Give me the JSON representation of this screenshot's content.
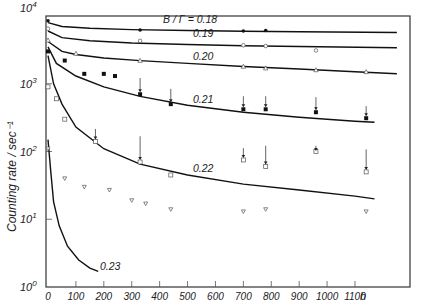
{
  "chart_data": {
    "type": "scatter",
    "title": "",
    "xlabel": "h",
    "ylabel": "Counting rate / sec⁻¹",
    "yscale": "log",
    "xlim": [
      0,
      1250
    ],
    "ylim": [
      1,
      10000
    ],
    "x_ticks": [
      0,
      100,
      200,
      300,
      400,
      500,
      600,
      700,
      800,
      900,
      1000,
      1100
    ],
    "x_tick_labels": [
      "0",
      "100",
      "200",
      "300",
      "400",
      "500",
      "600",
      "700",
      "800",
      "900",
      "1000",
      "1100"
    ],
    "y_ticks": [
      1,
      10,
      100,
      1000,
      10000
    ],
    "y_tick_labels": [
      {
        "base": "10",
        "exp": "0"
      },
      {
        "base": "10",
        "exp": "1"
      },
      {
        "base": "10",
        "exp": "2"
      },
      {
        "base": "10",
        "exp": "3"
      },
      {
        "base": "10",
        "exp": "4"
      }
    ],
    "grid": false,
    "legend_position": "inline curve labels",
    "parameter_label": "B / Γ =",
    "series": [
      {
        "name": "0.18",
        "label": "B / Γ = 0.18",
        "marker": "filled-circle",
        "curve": {
          "x": [
            0,
            50,
            150,
            300,
            500,
            700,
            900,
            1250
          ],
          "y": [
            8000,
            7000,
            6600,
            6300,
            6100,
            5950,
            5850,
            5700
          ]
        },
        "points": {
          "x": [
            0,
            330,
            700,
            780
          ],
          "y": [
            8500,
            6200,
            6000,
            6100
          ]
        }
      },
      {
        "name": "0.19",
        "label": "0.19",
        "marker": "open-circle",
        "curve": {
          "x": [
            0,
            50,
            150,
            300,
            500,
            700,
            900,
            1250
          ],
          "y": [
            6000,
            4800,
            4300,
            4000,
            3800,
            3650,
            3550,
            3400
          ]
        },
        "points": {
          "x": [
            0,
            330,
            700,
            780,
            960
          ],
          "y": [
            6500,
            4300,
            3700,
            3600,
            3100
          ]
        }
      },
      {
        "name": "0.20",
        "label": "0.20",
        "marker": "open-triangle",
        "curve": {
          "x": [
            0,
            50,
            100,
            200,
            330,
            500,
            700,
            900,
            1100,
            1250
          ],
          "y": [
            4200,
            3000,
            2700,
            2400,
            2200,
            2000,
            1800,
            1650,
            1500,
            1400
          ]
        },
        "points": {
          "x": [
            0,
            100,
            330,
            700,
            780,
            960,
            1140
          ],
          "y": [
            4400,
            2800,
            2200,
            1800,
            1700,
            1600,
            1500
          ]
        }
      },
      {
        "name": "0.21",
        "label": "0.21",
        "marker": "filled-square",
        "curve": {
          "x": [
            0,
            30,
            100,
            200,
            330,
            500,
            700,
            900,
            1100,
            1170
          ],
          "y": [
            3500,
            2000,
            1300,
            900,
            650,
            480,
            380,
            320,
            280,
            270
          ]
        },
        "points": {
          "x": [
            0,
            60,
            130,
            200,
            240,
            330,
            440,
            700,
            780,
            960,
            1140
          ],
          "y": [
            3000,
            2200,
            1400,
            1400,
            1300,
            700,
            500,
            420,
            420,
            380,
            310
          ]
        }
      },
      {
        "name": "0.22",
        "label": "0.22",
        "marker": "open-square",
        "curve": {
          "x": [
            0,
            20,
            50,
            100,
            200,
            330,
            500,
            700,
            900,
            1100,
            1170
          ],
          "y": [
            2600,
            1000,
            500,
            230,
            110,
            65,
            45,
            33,
            27,
            22,
            20
          ]
        },
        "points": {
          "x": [
            0,
            30,
            60,
            170,
            330,
            440,
            700,
            780,
            960,
            1140
          ],
          "y": [
            900,
            600,
            300,
            140,
            70,
            45,
            75,
            60,
            100,
            50
          ]
        }
      },
      {
        "name": "0.23",
        "label": "0.23",
        "marker": "open-triangle-down",
        "curve": {
          "x": [
            0,
            10,
            20,
            40,
            70,
            110,
            150,
            180
          ],
          "y": [
            150,
            50,
            18,
            8,
            4,
            2.5,
            1.9,
            1.7
          ]
        },
        "points": {
          "x": [
            0,
            60,
            130,
            220,
            300,
            350,
            440,
            700,
            780,
            1140
          ],
          "y": [
            110,
            40,
            30,
            27,
            19,
            17,
            14,
            13,
            14,
            13
          ]
        }
      }
    ],
    "arrows_note": "Vertical arrows connect paired markers indicating shift of counting rate"
  }
}
